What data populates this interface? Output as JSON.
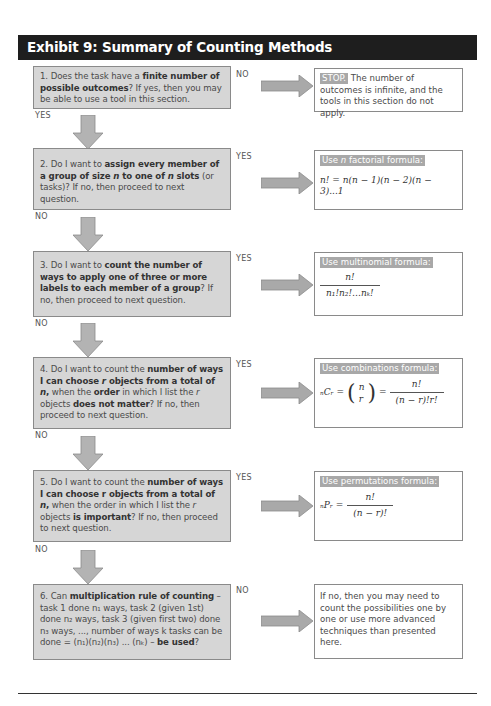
{
  "header": {
    "title": "Exhibit 9: Summary of Counting Methods"
  },
  "colors": {
    "header_bg": "#1e1e1e",
    "question_bg": "#d6d6d6",
    "arrow": "#a9a9a9",
    "tag_bg": "#a8a8a8"
  },
  "questions": [
    {
      "number": "1.",
      "parts": [
        "Does the task have a ",
        "finite number of possible outcomes",
        "? If yes, then you may be able to use a tool in this section."
      ],
      "side_label": "NO",
      "down_label": "YES",
      "result": {
        "tag": "STOP.",
        "text": "The number of outcomes is infinite, and the tools in this section do not apply."
      }
    },
    {
      "number": "2.",
      "parts": [
        "Do I want to ",
        "assign every member of a group of size ",
        "n",
        " to one of ",
        "n",
        " slots",
        " (or tasks)? If no, then proceed to next question."
      ],
      "side_label": "YES",
      "down_label": "NO",
      "result": {
        "tag_pre": "Use ",
        "tag_italic": "n",
        "tag_post": " factorial formula:",
        "formula": "n! = n(n − 1)(n − 2)(n − 3)...1"
      }
    },
    {
      "number": "3.",
      "parts": [
        "Do I want to ",
        "count the number of ways to apply one of three or more labels to each member of a group",
        "? If no, then proceed to next question."
      ],
      "side_label": "YES",
      "down_label": "NO",
      "result": {
        "tag": "Use multinomial formula:",
        "numerator": "n!",
        "denominator": "n₁!n₂!…nₖ!"
      }
    },
    {
      "number": "4.",
      "parts": [
        "Do I want to count the ",
        "number of ways I can choose ",
        "r",
        " objects from a total of ",
        "n",
        ",",
        " when the ",
        "order",
        " in which I list the ",
        "r",
        " objects ",
        "does not matter",
        "? If no, then proceed to next question."
      ],
      "side_label": "YES",
      "down_label": "NO",
      "result": {
        "tag": "Use combinations formula:",
        "lhs": "ₙCᵣ =",
        "binom_top": "n",
        "binom_bottom": "r",
        "eq": "=",
        "numerator": "n!",
        "denominator": "(n − r)!r!"
      }
    },
    {
      "number": "5.",
      "parts": [
        "Do I want to count the ",
        "number of ways I can choose r objects from a total of ",
        "n",
        ",",
        " when the order in which I list the ",
        "r",
        " objects ",
        "is important",
        "? If no, then proceed to next question."
      ],
      "side_label": "YES",
      "down_label": "NO",
      "result": {
        "tag": "Use permutations formula:",
        "lhs": "ₙPᵣ =",
        "numerator": "n!",
        "denominator": "(n − r)!"
      }
    },
    {
      "number": "6.",
      "parts": [
        "Can ",
        "multiplication rule of counting",
        " – task 1 done n₁ ways, task 2 (given 1st) done n₂ ways, task 3 (given first two) done n₃ ways, ..., number of ways k tasks can be done = (n₁)(n₂)(n₃) ... (nₖ) – ",
        "be used",
        "?"
      ],
      "side_label": "NO",
      "result": {
        "text": "If no, then you may need to count the possibilities one by one or use more advanced techniques than presented here."
      }
    }
  ]
}
